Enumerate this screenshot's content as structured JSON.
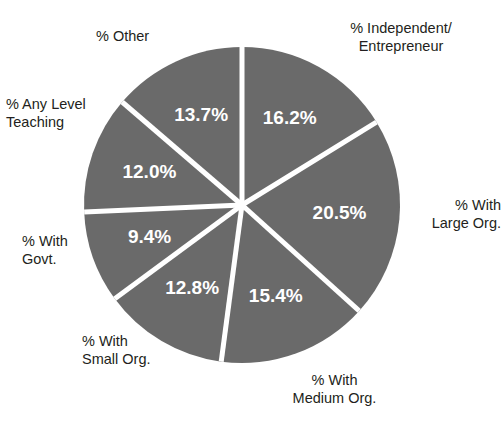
{
  "chart": {
    "title_partial": "",
    "background_color": "#ffffff",
    "slice_color": "#6a6a6a",
    "divider_color": "#ffffff",
    "label_color": "#231f20",
    "slice_label_color": "#ffffff"
  },
  "chart_data": {
    "type": "pie",
    "title": "",
    "xlabel": "",
    "ylabel": "",
    "legend_position": "callouts-around-pie",
    "grid": false,
    "units": "percent",
    "categories": [
      "% Independent/ Entrepreneur",
      "% With Large Org.",
      "% With Medium Org.",
      "% With Small Org.",
      "% With Govt.",
      "% Any Level Teaching",
      "% Other"
    ],
    "values": [
      16.2,
      20.5,
      15.4,
      12.8,
      9.4,
      12.0,
      13.7
    ],
    "data_labels": [
      "16.2%",
      "20.5%",
      "15.4%",
      "12.8%",
      "9.4%",
      "12.0%",
      "13.7%"
    ],
    "total": 100.0,
    "start_angle_deg": 0,
    "direction": "clockwise",
    "slices": [
      {
        "key": "independent",
        "label_line1": "% Independent/",
        "label_line2": "Entrepreneur",
        "value": 16.2,
        "data_label": "16.2%",
        "color": "#6a6a6a"
      },
      {
        "key": "large-org",
        "label_line1": "% With",
        "label_line2": "Large Org.",
        "value": 20.5,
        "data_label": "20.5%",
        "color": "#6a6a6a"
      },
      {
        "key": "medium-org",
        "label_line1": "% With",
        "label_line2": "Medium Org.",
        "value": 15.4,
        "data_label": "15.4%",
        "color": "#6a6a6a"
      },
      {
        "key": "small-org",
        "label_line1": "% With",
        "label_line2": "Small Org.",
        "value": 12.8,
        "data_label": "12.8%",
        "color": "#6a6a6a"
      },
      {
        "key": "govt",
        "label_line1": "% With",
        "label_line2": "Govt.",
        "value": 9.4,
        "data_label": "9.4%",
        "color": "#6a6a6a"
      },
      {
        "key": "any-level-teaching",
        "label_line1": "% Any Level",
        "label_line2": "Teaching",
        "value": 12.0,
        "data_label": "12.0%",
        "color": "#6a6a6a"
      },
      {
        "key": "other",
        "label_line1": "% Other",
        "label_line2": "",
        "value": 13.7,
        "data_label": "13.7%",
        "color": "#6a6a6a"
      }
    ]
  },
  "callouts": {
    "independent": "% Independent/\nEntrepreneur",
    "large_org": "% With\nLarge Org.",
    "medium_org": "% With\nMedium Org.",
    "small_org": "% With\nSmall Org.",
    "govt": "% With\nGovt.",
    "any_level_teaching": "% Any Level\nTeaching",
    "other": "% Other"
  },
  "slice_labels": {
    "independent": "16.2%",
    "large_org": "20.5%",
    "medium_org": "15.4%",
    "small_org": "12.8%",
    "govt": "9.4%",
    "any_level_teaching": "12.0%",
    "other": "13.7%"
  }
}
